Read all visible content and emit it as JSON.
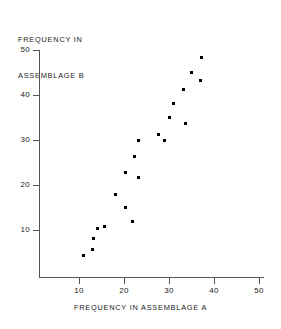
{
  "chart_data": {
    "type": "scatter",
    "title": "",
    "xlabel": "FREQUENCY IN ASSEMBLAGE A",
    "ylabel_lines": [
      "FREQUENCY IN",
      "ASSEMBLAGE B"
    ],
    "ylabel": "FREQUENCY IN ASSEMBLAGE B",
    "xlim": [
      0,
      50
    ],
    "ylim": [
      0,
      50
    ],
    "xticks": [
      10,
      20,
      30,
      40,
      50
    ],
    "yticks": [
      10,
      20,
      30,
      40,
      50
    ],
    "xtick_labels": [
      "10",
      "20",
      "30",
      "40",
      "50"
    ],
    "ytick_labels": [
      "10",
      "20",
      "30",
      "40",
      "50"
    ],
    "grid": false,
    "legend": null,
    "marker": "square",
    "marker_color": "#000000",
    "points": [
      {
        "x": 10.9,
        "y": 4.4
      },
      {
        "x": 12.9,
        "y": 5.7
      },
      {
        "x": 13.3,
        "y": 8.2
      },
      {
        "x": 14.0,
        "y": 10.4
      },
      {
        "x": 15.6,
        "y": 10.7
      },
      {
        "x": 18.2,
        "y": 17.8
      },
      {
        "x": 20.4,
        "y": 15.1
      },
      {
        "x": 20.4,
        "y": 22.7
      },
      {
        "x": 21.8,
        "y": 11.8
      },
      {
        "x": 22.4,
        "y": 26.4
      },
      {
        "x": 23.3,
        "y": 21.6
      },
      {
        "x": 23.3,
        "y": 30.0
      },
      {
        "x": 27.6,
        "y": 31.3
      },
      {
        "x": 28.9,
        "y": 29.8
      },
      {
        "x": 30.0,
        "y": 34.9
      },
      {
        "x": 31.1,
        "y": 38.2
      },
      {
        "x": 33.3,
        "y": 41.3
      },
      {
        "x": 33.7,
        "y": 33.6
      },
      {
        "x": 34.9,
        "y": 44.9
      },
      {
        "x": 37.1,
        "y": 43.3
      },
      {
        "x": 37.3,
        "y": 48.4
      }
    ]
  }
}
